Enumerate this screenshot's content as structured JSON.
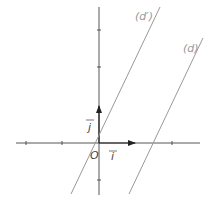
{
  "diagram": {
    "type": "cartesian-coordinate-system",
    "origin_label": "O",
    "vector_i_label": "i",
    "vector_j_label": "j",
    "lines": [
      {
        "name": "d_prime",
        "label": "(d′)"
      },
      {
        "name": "d",
        "label": "(d)"
      }
    ],
    "colors": {
      "axes": "#444444",
      "lines": "#999999",
      "labels": "#888888"
    }
  }
}
